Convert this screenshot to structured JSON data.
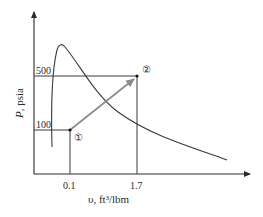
{
  "diagram": {
    "type": "P-v process diagram",
    "y_axis": {
      "label_symbol": "P",
      "label_unit": ", psia",
      "ticks": [
        "100",
        "500"
      ]
    },
    "x_axis": {
      "label": "υ, ft³/lbm",
      "ticks": [
        "0.1",
        "1.7"
      ]
    },
    "states": [
      {
        "id": "1",
        "label": "①",
        "v": 0.1,
        "P": 100
      },
      {
        "id": "2",
        "label": "②",
        "v": 1.7,
        "P": 500
      }
    ],
    "process": {
      "from": "1",
      "to": "2",
      "style": "straight arrow"
    },
    "curve": "saturation dome",
    "colors": {
      "axis": "#2a2a2a",
      "curve": "#3a3a3a",
      "process_arrow": "#8a8a8a",
      "guide_lines": "#3a3a3a"
    }
  }
}
